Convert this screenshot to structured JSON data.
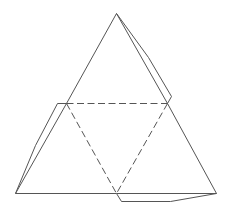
{
  "diagram": {
    "type": "tetrahedron-net",
    "colors": {
      "background": "#ffffff",
      "line": "#555555"
    },
    "vertices": {
      "apex": [
        116,
        13
      ],
      "left_mid": [
        66,
        103
      ],
      "right_mid": [
        167,
        103
      ],
      "bottom_left": [
        15,
        193
      ],
      "bottom_mid": [
        116,
        193
      ],
      "bottom_right": [
        216,
        193
      ]
    },
    "outline_edges": [
      {
        "from": "apex",
        "to": "left_mid"
      },
      {
        "from": "left_mid",
        "to": "bottom_left"
      },
      {
        "from": "bottom_left",
        "to": "bottom_mid"
      },
      {
        "from": "bottom_mid",
        "to": "bottom_right"
      },
      {
        "from": "bottom_right",
        "to": "right_mid"
      },
      {
        "from": "right_mid",
        "to": "apex"
      }
    ],
    "fold_lines": [
      {
        "from": "left_mid",
        "to": "right_mid",
        "style": "dashed"
      },
      {
        "from": "left_mid",
        "to": "bottom_mid",
        "style": "dashed"
      },
      {
        "from": "right_mid",
        "to": "bottom_mid",
        "style": "dashed"
      }
    ],
    "tabs": [
      {
        "name": "right-tab",
        "points": [
          [
            116,
            13
          ],
          [
            148,
            57
          ],
          [
            171,
            96
          ],
          [
            167,
            103
          ]
        ]
      },
      {
        "name": "left-tab",
        "points": [
          [
            66,
            103
          ],
          [
            57,
            103
          ],
          [
            35,
            145
          ],
          [
            15,
            193
          ]
        ]
      },
      {
        "name": "bottom-tab",
        "points": [
          [
            116,
            193
          ],
          [
            121,
            201
          ],
          [
            170,
            201
          ],
          [
            216,
            193
          ]
        ]
      }
    ]
  }
}
